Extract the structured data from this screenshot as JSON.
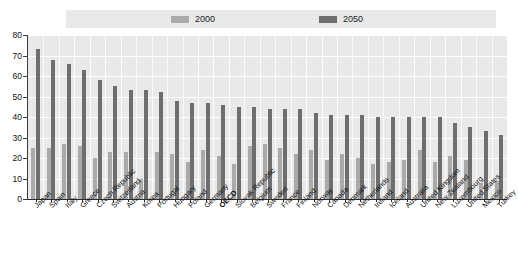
{
  "legend": {
    "items": [
      {
        "label": "2000",
        "color": "#aaaaaa",
        "name": "legend-2000"
      },
      {
        "label": "2050",
        "color": "#6e6e6e",
        "name": "legend-2050"
      }
    ]
  },
  "axis": {
    "y_ticks": [
      "80",
      "70",
      "60",
      "50",
      "40",
      "30",
      "20",
      "10",
      "0"
    ]
  },
  "colors": {
    "series_2000": "#aaaaaa",
    "series_2050": "#6e6e6e",
    "plot_background": "#e9e9e9",
    "gridline": "#ffffff",
    "axis": "#2b2b2b"
  },
  "chart_data": {
    "type": "bar",
    "title": "",
    "subtitle": "",
    "xlabel": "",
    "ylabel": "",
    "ylim": [
      0,
      80
    ],
    "ytick_step": 10,
    "grid": true,
    "legend_position": "top",
    "categories": [
      "Japan",
      "Spain",
      "Italy",
      "Greece",
      "Czech Republic",
      "Switzerland",
      "Austria",
      "Korea",
      "Portugal",
      "Hungary",
      "Poland",
      "Germany",
      "OECD",
      "Slovak Republic",
      "Belgium",
      "Sweden",
      "France",
      "Finland",
      "Norway",
      "Canada",
      "Denmark",
      "Netherlands",
      "Ireland",
      "Iceland",
      "Australia",
      "United Kingdom",
      "New Zealand",
      "Luxembourg",
      "United States",
      "Mexico",
      "Turkey"
    ],
    "highlight_category": "OECD",
    "series": [
      {
        "name": "2000",
        "color": "#aaaaaa",
        "values": [
          25,
          25,
          27,
          26,
          20,
          23,
          23,
          10,
          23,
          22,
          18,
          24,
          21,
          17,
          26,
          27,
          25,
          22,
          24,
          19,
          22,
          20,
          17,
          18,
          19,
          24,
          18,
          21,
          19,
          8,
          9
        ]
      },
      {
        "name": "2050",
        "color": "#6e6e6e",
        "values": [
          73,
          68,
          66,
          63,
          58,
          55,
          53,
          53,
          52,
          48,
          47,
          47,
          46,
          45,
          45,
          44,
          44,
          44,
          42,
          41,
          41,
          41,
          40,
          40,
          40,
          40,
          40,
          37,
          35,
          33,
          31
        ]
      }
    ]
  }
}
